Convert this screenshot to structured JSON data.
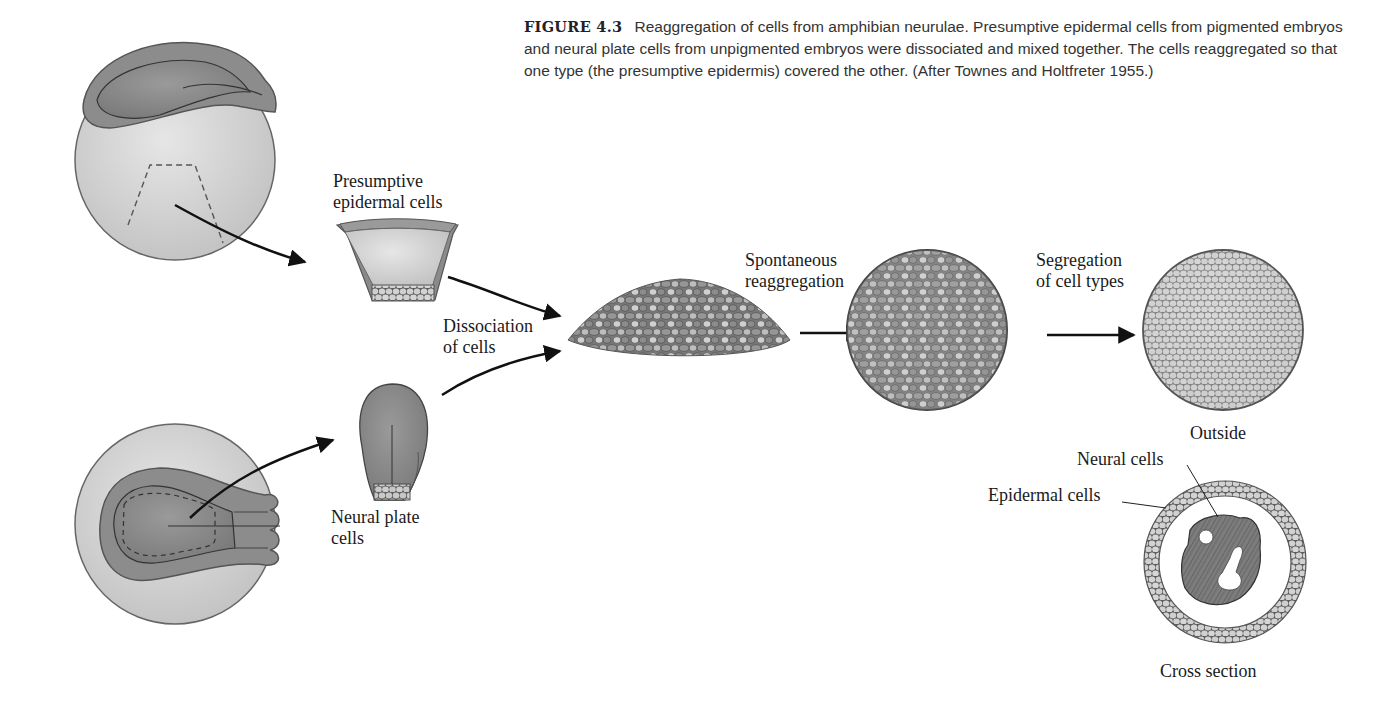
{
  "figure": {
    "number": "FIGURE 4.3",
    "caption": "Reaggregation of cells from amphibian neurulae. Presumptive epidermal cells from pigmented embryos and neural plate cells from unpigmented embryos were dissociated and mixed together. The cells reaggregated so that one type (the presumptive epidermis) covered the other. (After Townes and Holtfreter 1955.)"
  },
  "labels": {
    "presumptive_epidermal_line1": "Presumptive",
    "presumptive_epidermal_line2": "epidermal cells",
    "neural_plate_line1": "Neural plate",
    "neural_plate_line2": "cells",
    "dissociation_line1": "Dissociation",
    "dissociation_line2": "of cells",
    "spontaneous_line1": "Spontaneous",
    "spontaneous_line2": "reaggregation",
    "segregation_line1": "Segregation",
    "segregation_line2": "of cell types",
    "outside": "Outside",
    "neural_cells": "Neural cells",
    "epidermal_cells": "Epidermal cells",
    "cross_section": "Cross section"
  },
  "colors": {
    "light_tissue": "#d6d6d6",
    "dark_tissue": "#8a8a8a",
    "outline": "#555555",
    "arrow": "#111111"
  }
}
